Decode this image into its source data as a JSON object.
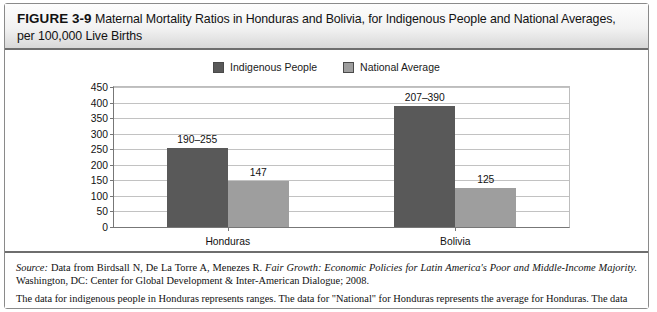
{
  "figure": {
    "number_label": "FIGURE 3-9",
    "title": "Maternal Mortality Ratios in Honduras and Bolivia, for Indigenous People and National Averages, per 100,000 Live Births"
  },
  "legend": {
    "items": [
      {
        "label": "Indigenous People",
        "color": "#595959"
      },
      {
        "label": "National Average",
        "color": "#9e9e9e"
      }
    ]
  },
  "notes": {
    "source_prefix": "Source:",
    "source_plain_1": " Data from Birdsall N, De La Torre A, Menezes R. ",
    "source_italic": "Fair Growth: Economic Policies for Latin America's Poor and Middle-Income Majority.",
    "source_plain_2": " Washington, DC: Center for Global Development & Inter-American Dialogue; 2008.",
    "body": "The data for indigenous people in Honduras represents ranges. The data for \"National\" for Honduras represents the average for Honduras. The data"
  },
  "chart_data": {
    "type": "bar",
    "title": "",
    "xlabel": "",
    "ylabel": "Maternal Deaths per 100,000 Live Births",
    "ylim": [
      0,
      450
    ],
    "ytick_step": 50,
    "yticks": [
      0,
      50,
      100,
      150,
      200,
      250,
      300,
      350,
      400,
      450
    ],
    "ytick_labels": [
      "0",
      "50",
      "100",
      "150",
      "200",
      "250",
      "300",
      "350",
      "400",
      "450"
    ],
    "grid": true,
    "legend_position": "top-center",
    "categories": [
      "Honduras",
      "Bolivia"
    ],
    "series": [
      {
        "name": "Indigenous People",
        "color": "#595959",
        "values": [
          255,
          390
        ],
        "data_labels": [
          "190–255",
          "207–390"
        ]
      },
      {
        "name": "National Average",
        "color": "#9e9e9e",
        "values": [
          147,
          125
        ],
        "data_labels": [
          "147",
          "125"
        ]
      }
    ]
  }
}
